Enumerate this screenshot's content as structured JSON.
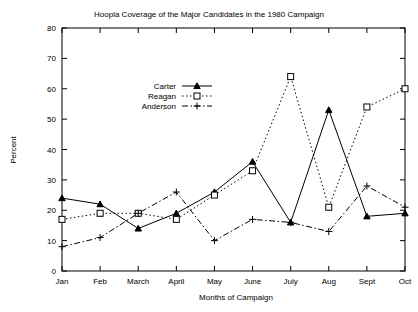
{
  "chart_data": {
    "type": "line",
    "title": "Hoopla Coverage of the Major Candidates in the 1980 Campaign",
    "xlabel": "Months of Campaign",
    "ylabel": "Percent",
    "categories": [
      "Jan",
      "Feb",
      "March",
      "April",
      "May",
      "June",
      "July",
      "Aug",
      "Sept",
      "Oct"
    ],
    "ylim": [
      0,
      80
    ],
    "yticks": [
      0,
      10,
      20,
      30,
      40,
      50,
      60,
      70,
      80
    ],
    "grid": false,
    "legend_position": "inside-upper-left",
    "series": [
      {
        "name": "Carter",
        "marker": "triangle",
        "linestyle": "solid",
        "values": [
          24,
          22,
          14,
          19,
          26,
          36,
          16,
          53,
          18,
          19
        ]
      },
      {
        "name": "Reagan",
        "marker": "open-square",
        "linestyle": "dotted",
        "values": [
          17,
          19,
          19,
          17,
          25,
          33,
          64,
          21,
          54,
          60
        ]
      },
      {
        "name": "Anderson",
        "marker": "plus",
        "linestyle": "dash-dot",
        "values": [
          8,
          11,
          19,
          26,
          10,
          17,
          16,
          13,
          28,
          21
        ]
      }
    ]
  },
  "colors": {
    "ink": "#000000",
    "background": "#ffffff"
  }
}
